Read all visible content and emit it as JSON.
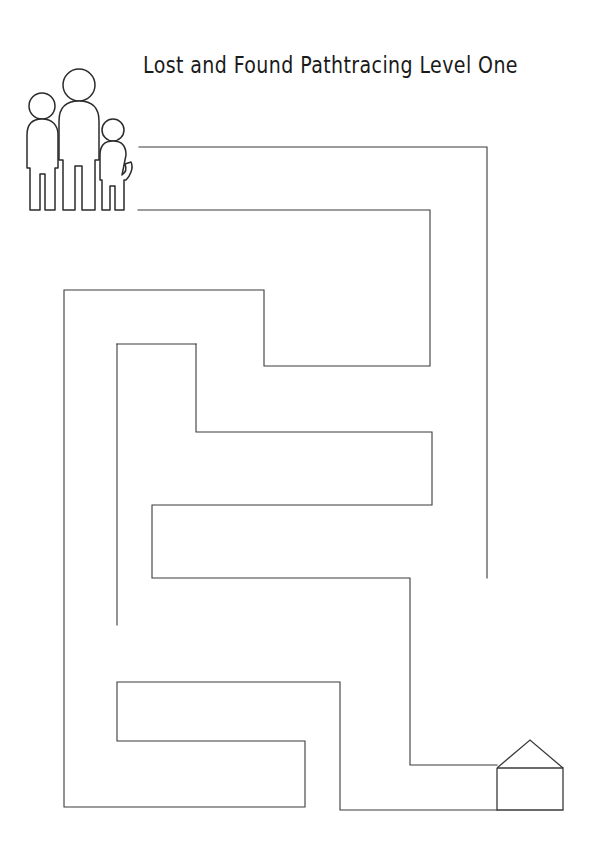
{
  "worksheet": {
    "title": "Lost and Found Pathtracing Level One",
    "kind": "maze-pathtracing-worksheet",
    "page_width": 597,
    "page_height": 863,
    "background_color": "#ffffff",
    "line_color": "#3a3a3a"
  },
  "start_marker": {
    "name": "family-group",
    "label": "",
    "figures": [
      {
        "name": "adult-medium",
        "height_rank": 2
      },
      {
        "name": "adult-tall",
        "height_rank": 1
      },
      {
        "name": "child-small",
        "height_rank": 3
      }
    ],
    "position": {
      "x": 18,
      "y": 62,
      "width": 120,
      "height": 150
    }
  },
  "end_marker": {
    "name": "house",
    "label": "",
    "position": {
      "x": 493,
      "y": 738,
      "width": 72,
      "height": 72
    }
  },
  "maze": {
    "stroke_color": "#3a3a3a",
    "stroke_width": 1.1,
    "walls": [
      {
        "id": "w1",
        "points": "139,147 487,147 487,578"
      },
      {
        "id": "w2",
        "points": "138,210 430,210 430,366 264,366 264,290 64,290 64,807 305,807 305,741 117,741 117,682 340,682 340,810 497,810"
      },
      {
        "id": "w3",
        "points": "196,344 196,432 432,432 432,505 152,505 152,578 410,578 410,765 497,765"
      },
      {
        "id": "w4",
        "points": "117,344 196,344"
      },
      {
        "id": "w5",
        "points": "117,344 117,625"
      }
    ]
  }
}
